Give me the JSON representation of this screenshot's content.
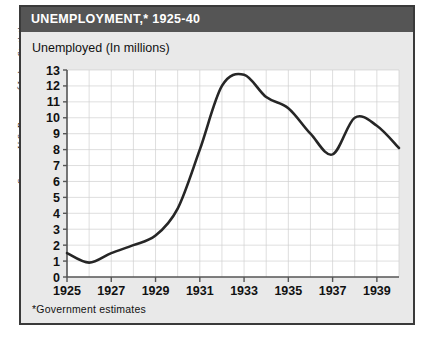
{
  "source_credit": "Source: U.S. Bureau of Labor Statistics",
  "panel": {
    "title": "UNEMPLOYMENT,* 1925-40",
    "subtitle": "Unemployed (In millions)",
    "footnote": "*Government  estimates"
  },
  "colors": {
    "titlebar_bg": "#555555",
    "title_text": "#ffffff",
    "panel_bg": "#e9e9e9",
    "panel_border": "#3a3a3a",
    "plot_bg": "#ffffff",
    "grid": "#d0d0d0",
    "axis": "#555555",
    "line": "#262626"
  },
  "chart_data": {
    "type": "line",
    "title": "UNEMPLOYMENT,* 1925-40",
    "subtitle": "Unemployed (In millions)",
    "xlabel": "",
    "ylabel": "Unemployed (In millions)",
    "xlim": [
      1925,
      1940
    ],
    "ylim": [
      0,
      13
    ],
    "grid": true,
    "legend": "none",
    "x_tick_labels": [
      "1925",
      "1927",
      "1929",
      "1931",
      "1933",
      "1935",
      "1937",
      "1939"
    ],
    "x_tick_values": [
      1925,
      1927,
      1929,
      1931,
      1933,
      1935,
      1937,
      1939
    ],
    "y_tick_labels": [
      "0",
      "1",
      "2",
      "3",
      "4",
      "5",
      "6",
      "7",
      "8",
      "9",
      "10",
      "11",
      "12",
      "13"
    ],
    "y_tick_values": [
      0,
      1,
      2,
      3,
      4,
      5,
      6,
      7,
      8,
      9,
      10,
      11,
      12,
      13
    ],
    "x": [
      1925,
      1926,
      1927,
      1928,
      1929,
      1930,
      1931,
      1932,
      1933,
      1934,
      1935,
      1936,
      1937,
      1938,
      1939,
      1940
    ],
    "values": [
      1.5,
      0.9,
      1.5,
      2.0,
      2.6,
      4.3,
      8.0,
      12.0,
      12.7,
      11.3,
      10.6,
      9.0,
      7.7,
      10.0,
      9.5,
      8.1
    ],
    "series": [
      {
        "name": "Unemployed (In millions)",
        "values": [
          1.5,
          0.9,
          1.5,
          2.0,
          2.6,
          4.3,
          8.0,
          12.0,
          12.7,
          11.3,
          10.6,
          9.0,
          7.7,
          10.0,
          9.5,
          8.1
        ]
      }
    ],
    "annotations": [
      "*Government  estimates"
    ]
  }
}
